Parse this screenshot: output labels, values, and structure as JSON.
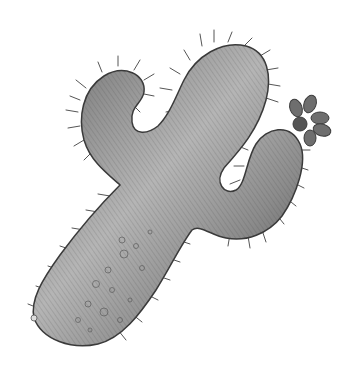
{
  "image": {
    "subject": "Pencil sketch of a cactus",
    "background_color": "#ffffff",
    "colors": {
      "body_light": "#c8c8c8",
      "body_mid": "#8a8a8a",
      "body_dark": "#3a3a3a",
      "spine": "#555555",
      "flower": "#6e6e6e",
      "flower_dark": "#3c3c3c"
    }
  }
}
